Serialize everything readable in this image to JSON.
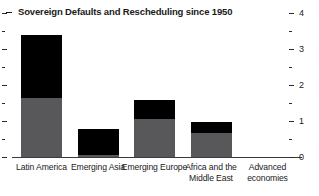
{
  "header": {
    "title": "Sovereign Defaults and Rescheduling since 1950",
    "dash_marker": "title-dash"
  },
  "chart_data": {
    "type": "bar",
    "stacked": true,
    "title": "Sovereign Defaults and Rescheduling since 1950",
    "xlabel": "",
    "ylabel": "",
    "ylim": [
      0,
      4
    ],
    "y_axis_position": "right",
    "grid": false,
    "legend": "none",
    "y_ticks_major": [
      0,
      1,
      2,
      3,
      4
    ],
    "y_tick_labels": [
      "0",
      "1",
      "2",
      "3",
      "4"
    ],
    "y_ticks_minor": [
      0.5,
      1.5,
      2.5,
      3.5
    ],
    "categories": [
      "Latin America",
      "Emerging Asia",
      "Emerging Europe",
      "Africa and the Middle East",
      "Advanced economies"
    ],
    "series": [
      {
        "name": "lower-segment",
        "color": "#58585a",
        "values": [
          1.68,
          0.08,
          1.08,
          0.69,
          0
        ]
      },
      {
        "name": "upper-segment",
        "color": "#000000",
        "values": [
          1.74,
          0.73,
          0.53,
          0.31,
          0
        ]
      }
    ],
    "totals": [
      3.42,
      0.81,
      1.61,
      1.0,
      0
    ]
  },
  "colors": {
    "black": "#000000",
    "gray": "#58585a",
    "axis": "#3a3a3a",
    "text": "#1a1a1a",
    "background": "#ffffff"
  }
}
